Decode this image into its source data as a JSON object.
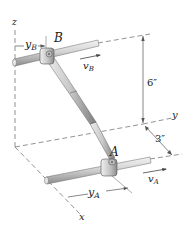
{
  "figure": {
    "colors": {
      "shaft_fill": "#d8d8d8",
      "shaft_shadow": "#9a9a9a",
      "line": "#555555",
      "dashed": "#777777",
      "text": "#222222"
    }
  },
  "axes": {
    "x_label": "x",
    "y_label": "y",
    "z_label": "z"
  },
  "collars": {
    "A": {
      "label": "A",
      "velocity_label": "v",
      "velocity_sub": "A",
      "position_label": "y",
      "position_sub": "A"
    },
    "B": {
      "label": "B",
      "velocity_label": "v",
      "velocity_sub": "B",
      "position_label": "y",
      "position_sub": "B"
    }
  },
  "dimensions": {
    "vertical": "6″",
    "horizontal": "3″"
  }
}
